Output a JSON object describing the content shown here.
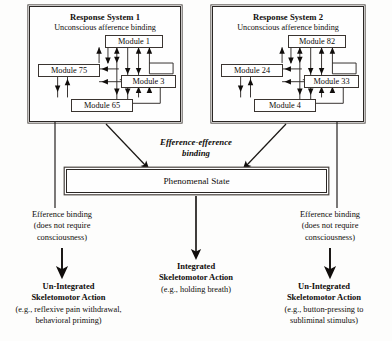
{
  "diagram": {
    "systems": [
      {
        "title": "Response System 1",
        "subtitle": "Unconscious afference binding",
        "modules": [
          {
            "label": "Module 1",
            "x": 75,
            "y": 28,
            "w": 58
          },
          {
            "label": "Module 75",
            "x": 8,
            "y": 57,
            "w": 62
          },
          {
            "label": "Module 3",
            "x": 91,
            "y": 68,
            "w": 55
          },
          {
            "label": "Module 65",
            "x": 41,
            "y": 92,
            "w": 62
          }
        ]
      },
      {
        "title": "Response System 2",
        "subtitle": "Unconscious afference binding",
        "modules": [
          {
            "label": "Module 82",
            "x": 75,
            "y": 28,
            "w": 58
          },
          {
            "label": "Module 24",
            "x": 8,
            "y": 57,
            "w": 62
          },
          {
            "label": "Module 33",
            "x": 91,
            "y": 68,
            "w": 55
          },
          {
            "label": "Module 4",
            "x": 41,
            "y": 92,
            "w": 62
          }
        ]
      }
    ],
    "efference_efference_binding": {
      "line1": "Efference-efference",
      "line2": "binding"
    },
    "phenomenal_state": "Phenomenal State",
    "efference_binding_left": {
      "line1": "Efference binding",
      "line2": "(does not require",
      "line3": "consciousness)"
    },
    "efference_binding_right": {
      "line1": "Efference binding",
      "line2": "(does not require",
      "line3": "consciousness)"
    },
    "outcomes": {
      "left": {
        "title_line1": "Un-Integrated",
        "title_line2": "Skeletomotor Action",
        "eg_line1": "(e.g., reflexive pain withdrawal,",
        "eg_line2": "behavioral priming)"
      },
      "middle": {
        "title_line1": "Integrated",
        "title_line2": "Skeletomotor Action",
        "eg_line1": "(e.g., holding breath)",
        "eg_line2": ""
      },
      "right": {
        "title_line1": "Un-Integrated",
        "title_line2": "Skeletomotor Action",
        "eg_line1": "(e.g., button-pressing to",
        "eg_line2": "subliminal stimulus)"
      }
    },
    "caption": "",
    "colors": {
      "ink": "#100d0b",
      "line": "#2b2724",
      "background": "#fdfdfc"
    }
  }
}
